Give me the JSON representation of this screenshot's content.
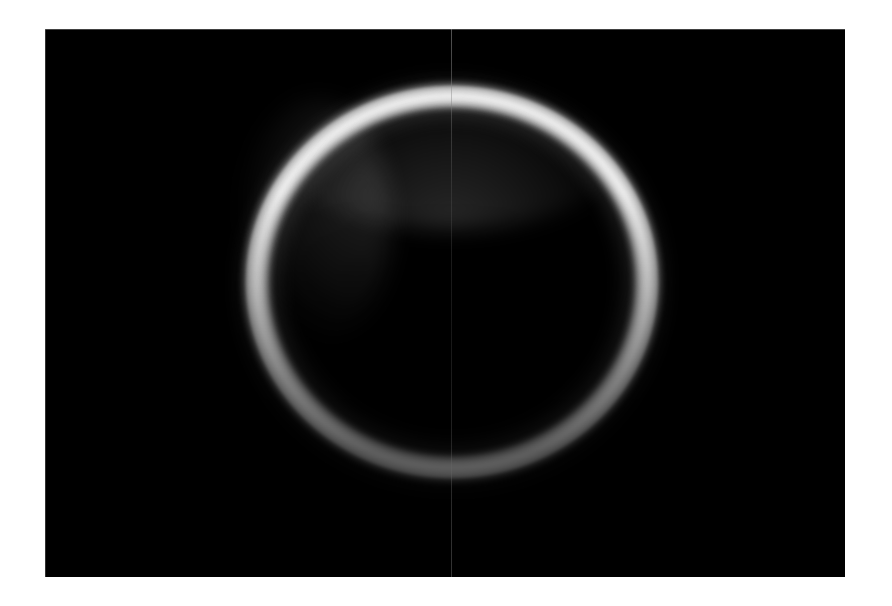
{
  "page": {
    "background_color": "#ffffff",
    "width": 892,
    "height": 606
  },
  "plate": {
    "name": "astronomical-image-plate",
    "background_color": "#000000",
    "left": 45,
    "top": 29,
    "width": 800,
    "height": 548,
    "caption": "",
    "label": ""
  },
  "overlay": {
    "meridian_line": {
      "label": "",
      "x": 406,
      "color": "#6b6b6b",
      "orientation": "vertical"
    }
  },
  "chart_data": {
    "type": "heatmap",
    "title": "",
    "subtitle": "",
    "xlabel": "",
    "ylabel": "",
    "grid": false,
    "legend": "none",
    "colormap": "grayscale",
    "background": "#000000",
    "image_extent_px": [
      45,
      29,
      845,
      577
    ],
    "ring": {
      "center_x": 452,
      "center_y": 282,
      "semi_axis_x": 213,
      "semi_axis_y": 203,
      "ring_thickness_px": 22,
      "peak_intensity": 235,
      "background_intensity": 4
    },
    "angular_profile": {
      "angle_deg": [
        0,
        30,
        60,
        90,
        120,
        150,
        180,
        210,
        240,
        270,
        300,
        330
      ],
      "intensity": [
        150,
        205,
        232,
        235,
        228,
        196,
        132,
        92,
        74,
        70,
        78,
        104
      ]
    },
    "radial_profile": {
      "radius_fraction": [
        0.0,
        0.2,
        0.4,
        0.6,
        0.75,
        0.85,
        0.92,
        0.96,
        1.0,
        1.06,
        1.14,
        1.25
      ],
      "intensity": [
        3,
        3,
        3,
        4,
        8,
        60,
        180,
        235,
        210,
        130,
        55,
        10
      ]
    }
  }
}
